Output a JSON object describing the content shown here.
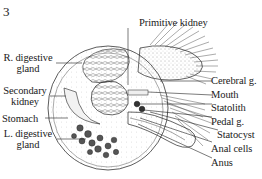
{
  "figure": {
    "number": "3",
    "labels": {
      "primitive_kidney": "Primitive kidney",
      "r_digestive_gland_1": "R. digestive",
      "r_digestive_gland_2": "gland",
      "secondary_kidney_1": "Secondary",
      "secondary_kidney_2": "kidney",
      "stomach": "Stomach",
      "l_digestive_gland_1": "L. digestive",
      "l_digestive_gland_2": "gland",
      "cerebral_g": "Cerebral g.",
      "mouth": "Mouth",
      "statolith": "Statolith",
      "pedal_g": "Pedal g.",
      "statocyst": "Statocyst",
      "anal_cells": "Anal cells",
      "anus": "Anus"
    },
    "colors": {
      "ink": "#1a1a1a",
      "stipple": "#6a6a6a",
      "background": "#ffffff"
    }
  }
}
